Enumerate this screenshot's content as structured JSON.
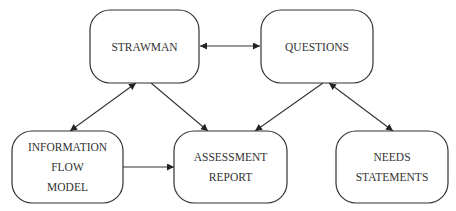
{
  "diagram": {
    "type": "flow",
    "clipped_top_text": "",
    "nodes": [
      {
        "id": "strawman",
        "lines": [
          "STRAWMAN"
        ]
      },
      {
        "id": "questions",
        "lines": [
          "QUESTIONS"
        ]
      },
      {
        "id": "info_flow",
        "lines": [
          "INFORMATION",
          "FLOW",
          "MODEL"
        ]
      },
      {
        "id": "assessment",
        "lines": [
          "ASSESSMENT",
          "REPORT"
        ]
      },
      {
        "id": "needs",
        "lines": [
          "NEEDS",
          "STATEMENTS"
        ]
      }
    ],
    "edges": [
      {
        "from": "strawman",
        "to": "questions",
        "bidirectional": true
      },
      {
        "from": "strawman",
        "to": "info_flow",
        "bidirectional": true
      },
      {
        "from": "strawman",
        "to": "assessment",
        "bidirectional": false
      },
      {
        "from": "questions",
        "to": "assessment",
        "bidirectional": false
      },
      {
        "from": "questions",
        "to": "needs",
        "bidirectional": true
      },
      {
        "from": "info_flow",
        "to": "assessment",
        "bidirectional": false
      }
    ],
    "colors": {
      "stroke": "#333333",
      "text": "#333333",
      "background": "#ffffff"
    }
  }
}
